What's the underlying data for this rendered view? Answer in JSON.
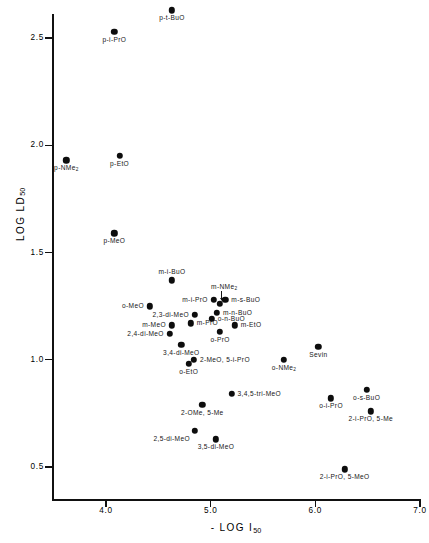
{
  "chart_data": {
    "type": "scatter",
    "title": "",
    "xlabel": "- LOG I50",
    "ylabel": "LOG LD50",
    "xlabel_parts": {
      "prefix": "- LOG I",
      "sub": "50"
    },
    "ylabel_parts": {
      "prefix": "LOG  LD",
      "sub": "50"
    },
    "xlim": [
      3.35,
      7.0
    ],
    "ylim": [
      0.3,
      2.66
    ],
    "xticks": [
      4.0,
      5.0,
      6.0,
      7.0
    ],
    "xtick_labels": [
      "4.0",
      "5.0",
      "6.0",
      "7.0"
    ],
    "yticks": [
      0.5,
      1.0,
      1.5,
      2.0,
      2.5
    ],
    "ytick_labels": [
      "0.5",
      "1.0",
      "1.5",
      "2.0",
      "2.5"
    ],
    "grid": false,
    "legend": false,
    "marker": "filled-circle",
    "marker_color": "#0d0d0d",
    "points": [
      {
        "label": "p-t-BuO",
        "x": 4.63,
        "y": 2.63,
        "pos": "below-center"
      },
      {
        "label": "p-i-PrO",
        "x": 4.08,
        "y": 2.53,
        "pos": "below-center"
      },
      {
        "label": "p-NMe2",
        "x": 3.62,
        "y": 1.93,
        "pos": "below-center",
        "sub": "2"
      },
      {
        "label": "p-EtO",
        "x": 4.13,
        "y": 1.95,
        "pos": "below-center"
      },
      {
        "label": "p-MeO",
        "x": 4.08,
        "y": 1.59,
        "pos": "below-center"
      },
      {
        "label": "m-i-BuO",
        "x": 4.63,
        "y": 1.37,
        "pos": "above-center"
      },
      {
        "label": "m-i-PrO",
        "x": 5.03,
        "y": 1.28,
        "pos": "left"
      },
      {
        "label": "m-NMe2",
        "x": 5.09,
        "y": 1.26,
        "pos": "leader-up",
        "sub": "2"
      },
      {
        "label": "m-s-BuO",
        "x": 5.14,
        "y": 1.28,
        "pos": "right"
      },
      {
        "label": "m-n-BuO",
        "x": 5.06,
        "y": 1.22,
        "pos": "right"
      },
      {
        "label": "o-MeO",
        "x": 4.42,
        "y": 1.25,
        "pos": "left"
      },
      {
        "label": "2,3-di-MeO",
        "x": 4.85,
        "y": 1.21,
        "pos": "left"
      },
      {
        "label": "o-n-BuO",
        "x": 5.01,
        "y": 1.19,
        "pos": "right"
      },
      {
        "label": "m-MeO",
        "x": 4.63,
        "y": 1.16,
        "pos": "left"
      },
      {
        "label": "m-PrO",
        "x": 4.81,
        "y": 1.17,
        "pos": "right"
      },
      {
        "label": "m-EtO",
        "x": 5.23,
        "y": 1.16,
        "pos": "right"
      },
      {
        "label": "2,4-di-MeO",
        "x": 4.61,
        "y": 1.12,
        "pos": "left"
      },
      {
        "label": "o-PrO",
        "x": 5.09,
        "y": 1.13,
        "pos": "below-center"
      },
      {
        "label": "3,4-di-MeO",
        "x": 4.72,
        "y": 1.07,
        "pos": "below-center"
      },
      {
        "label": "Sevin",
        "x": 6.03,
        "y": 1.06,
        "pos": "below-center"
      },
      {
        "label": "2-MeO, 5-i-PrO",
        "x": 4.84,
        "y": 1.0,
        "pos": "right"
      },
      {
        "label": "o-NMe2",
        "x": 5.7,
        "y": 1.0,
        "pos": "below-center",
        "sub": "2"
      },
      {
        "label": "o-EtO",
        "x": 4.79,
        "y": 0.98,
        "pos": "below-center"
      },
      {
        "label": "3,4,5-tri-MeO",
        "x": 5.2,
        "y": 0.84,
        "pos": "right"
      },
      {
        "label": "o-s-BuO",
        "x": 6.49,
        "y": 0.86,
        "pos": "below-center"
      },
      {
        "label": "o-i-PrO",
        "x": 6.15,
        "y": 0.82,
        "pos": "below-center"
      },
      {
        "label": "2-OMe, 5-Me",
        "x": 4.92,
        "y": 0.79,
        "pos": "below-center"
      },
      {
        "label": "2-i-PrO, 5-Me",
        "x": 6.53,
        "y": 0.76,
        "pos": "below-center"
      },
      {
        "label": "2,5-di-MeO",
        "x": 4.85,
        "y": 0.67,
        "pos": "below-left"
      },
      {
        "label": "3,5-di-MeO",
        "x": 5.05,
        "y": 0.63,
        "pos": "below-center"
      },
      {
        "label": "2-i-PrO, 5-MeO",
        "x": 6.28,
        "y": 0.49,
        "pos": "below-center"
      }
    ]
  }
}
